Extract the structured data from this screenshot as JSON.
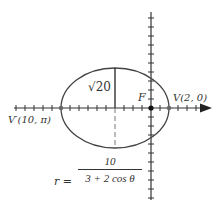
{
  "diagram": {
    "type": "polar-conic-ellipse",
    "labels": {
      "focus": "F",
      "vertex_right": "V(2, 0)",
      "vertex_left": "V′(10, π)",
      "semi_minor": "√20",
      "equation_lhs": "r =",
      "equation_numerator": "10",
      "equation_denominator": "3 + 2 cos θ"
    },
    "geometry": {
      "focus": [
        0,
        0
      ],
      "vertex_right": [
        2,
        0
      ],
      "vertex_left_polar": [
        10,
        "π"
      ],
      "center": [
        -4,
        0
      ],
      "semi_major": 6,
      "semi_minor": "√20",
      "tick_spacing": 1
    },
    "colors": {
      "stroke": "#444444",
      "axis": "#333333",
      "point": "#222222",
      "vertex_point": "#666666"
    }
  }
}
